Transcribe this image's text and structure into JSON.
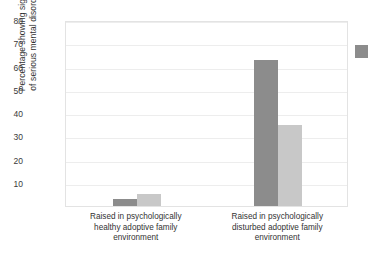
{
  "chart_data": {
    "type": "bar",
    "title": "",
    "xlabel": "",
    "ylabel": "Percentage showing signs of serious mental disorder",
    "ylabel_lines": [
      "Percentage showing signs",
      "of serious mental disorder"
    ],
    "ylim": [
      0,
      80
    ],
    "yticks": [
      80,
      70,
      60,
      50,
      40,
      30,
      20,
      10
    ],
    "grid": "horizontal",
    "legend_position": "right",
    "categories": [
      "Raised in psychologically healthy adoptive family environment",
      "Raised in psychologically disturbed adoptive family environment"
    ],
    "category_lines": [
      [
        "Raised in psychologically",
        "healthy adoptive family",
        "environment"
      ],
      [
        "Raised in psychologically",
        "disturbed adoptive family",
        "environment"
      ]
    ],
    "series": [
      {
        "name": "series-1",
        "color": "#8c8c8c",
        "values": [
          3,
          63
        ]
      },
      {
        "name": "series-2",
        "color": "#c8c8c8",
        "values": [
          5,
          35
        ]
      }
    ],
    "legend_entries": [
      {
        "label": "",
        "color": "#8c8c8c"
      }
    ]
  },
  "colors": {
    "series_dark": "#8c8c8c",
    "series_light": "#c8c8c8",
    "gridline": "#ededed",
    "frame": "#e3e3e3",
    "text": "#333333",
    "background": "#ffffff"
  }
}
